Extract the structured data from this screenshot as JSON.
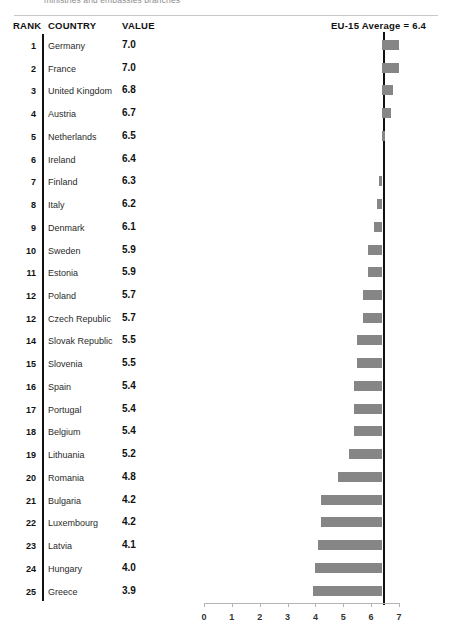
{
  "caption": {
    "text": "ministries and embassies branches"
  },
  "header": {
    "rank_label": "RANK",
    "country_label": "COUNTRY",
    "value_label": "VALUE",
    "average_label": "EU-15 Average = 6.4"
  },
  "chart_data": {
    "type": "bar",
    "title": "",
    "subtitle": "",
    "xlabel": "",
    "ylabel": "",
    "orientation": "horizontal",
    "grid": false,
    "legend": null,
    "xlim": [
      0,
      7
    ],
    "xticks": [
      0,
      1,
      2,
      3,
      4,
      5,
      6,
      7
    ],
    "xtick_labels": [
      "0",
      "1",
      "2",
      "3",
      "4",
      "5",
      "6",
      "7"
    ],
    "reference_line": {
      "label": "EU-15 Average = 6.4",
      "value": 6.4
    },
    "bar_color": "#868686",
    "baseline_note": "bars are drawn as deviations from the EU-15 average reference line at 6.4",
    "categories": [
      "Germany",
      "France",
      "United Kingdom",
      "Austria",
      "Netherlands",
      "Ireland",
      "Finland",
      "Italy",
      "Denmark",
      "Sweden",
      "Estonia",
      "Poland",
      "Czech Republic",
      "Slovak Republic",
      "Slovenia",
      "Spain",
      "Portugal",
      "Belgium",
      "Lithuania",
      "Romania",
      "Bulgaria",
      "Luxembourg",
      "Latvia",
      "Hungary",
      "Greece"
    ],
    "values": [
      7.0,
      7.0,
      6.8,
      6.7,
      6.5,
      6.4,
      6.3,
      6.2,
      6.1,
      5.9,
      5.9,
      5.7,
      5.7,
      5.5,
      5.5,
      5.4,
      5.4,
      5.4,
      5.2,
      4.8,
      4.2,
      4.2,
      4.1,
      4.0,
      3.9
    ],
    "ranks": [
      "1",
      "2",
      "3",
      "4",
      "5",
      "6",
      "7",
      "8",
      "9",
      "10",
      "11",
      "12",
      "12",
      "14",
      "15",
      "16",
      "17",
      "18",
      "19",
      "20",
      "21",
      "22",
      "23",
      "24",
      "25"
    ],
    "rows": [
      {
        "rank": "1",
        "country": "Germany",
        "value": "7.0",
        "v": 7.0
      },
      {
        "rank": "2",
        "country": "France",
        "value": "7.0",
        "v": 7.0
      },
      {
        "rank": "3",
        "country": "United Kingdom",
        "value": "6.8",
        "v": 6.8
      },
      {
        "rank": "4",
        "country": "Austria",
        "value": "6.7",
        "v": 6.7
      },
      {
        "rank": "5",
        "country": "Netherlands",
        "value": "6.5",
        "v": 6.5
      },
      {
        "rank": "6",
        "country": "Ireland",
        "value": "6.4",
        "v": 6.4
      },
      {
        "rank": "7",
        "country": "Finland",
        "value": "6.3",
        "v": 6.3
      },
      {
        "rank": "8",
        "country": "Italy",
        "value": "6.2",
        "v": 6.2
      },
      {
        "rank": "9",
        "country": "Denmark",
        "value": "6.1",
        "v": 6.1
      },
      {
        "rank": "10",
        "country": "Sweden",
        "value": "5.9",
        "v": 5.9
      },
      {
        "rank": "11",
        "country": "Estonia",
        "value": "5.9",
        "v": 5.9
      },
      {
        "rank": "12",
        "country": "Poland",
        "value": "5.7",
        "v": 5.7
      },
      {
        "rank": "12",
        "country": "Czech Republic",
        "value": "5.7",
        "v": 5.7
      },
      {
        "rank": "14",
        "country": "Slovak Republic",
        "value": "5.5",
        "v": 5.5
      },
      {
        "rank": "15",
        "country": "Slovenia",
        "value": "5.5",
        "v": 5.5
      },
      {
        "rank": "16",
        "country": "Spain",
        "value": "5.4",
        "v": 5.4
      },
      {
        "rank": "17",
        "country": "Portugal",
        "value": "5.4",
        "v": 5.4
      },
      {
        "rank": "18",
        "country": "Belgium",
        "value": "5.4",
        "v": 5.4
      },
      {
        "rank": "19",
        "country": "Lithuania",
        "value": "5.2",
        "v": 5.2
      },
      {
        "rank": "20",
        "country": "Romania",
        "value": "4.8",
        "v": 4.8
      },
      {
        "rank": "21",
        "country": "Bulgaria",
        "value": "4.2",
        "v": 4.2
      },
      {
        "rank": "22",
        "country": "Luxembourg",
        "value": "4.2",
        "v": 4.2
      },
      {
        "rank": "23",
        "country": "Latvia",
        "value": "4.1",
        "v": 4.1
      },
      {
        "rank": "24",
        "country": "Hungary",
        "value": "4.0",
        "v": 4.0
      },
      {
        "rank": "25",
        "country": "Greece",
        "value": "3.9",
        "v": 3.9
      }
    ]
  }
}
